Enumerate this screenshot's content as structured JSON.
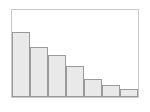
{
  "figure": {
    "name": "histogram-figure",
    "width": 150,
    "height": 112,
    "background_color": "#ffffff"
  },
  "plot": {
    "frame_color": "#c9c9c9",
    "plot_background": "#ffffff",
    "bar_fill_color": "#e9e9e9",
    "bar_edge_color": "#9a9a9a",
    "frame": {
      "left": 11,
      "top": 9,
      "width": 128,
      "height": 89
    }
  },
  "chart_data": {
    "type": "bar",
    "title": "",
    "subtitle": "",
    "xlabel": "",
    "ylabel": "",
    "grid": false,
    "legend": null,
    "legend_position": "none",
    "annotations": [],
    "categories": [
      "1",
      "2",
      "3",
      "4",
      "5",
      "6",
      "7"
    ],
    "tick_labels_visible": false,
    "values": [
      66,
      51,
      42,
      31,
      18,
      12,
      8
    ],
    "ylim": [
      0,
      88
    ],
    "xlim": [
      0,
      7
    ],
    "bar_width_fraction": 1.0,
    "series": [
      {
        "name": "frequency",
        "values": [
          66,
          51,
          42,
          31,
          18,
          12,
          8
        ]
      }
    ]
  }
}
